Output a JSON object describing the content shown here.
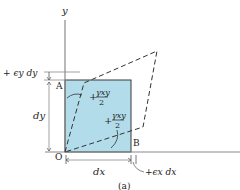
{
  "figure": {
    "caption": "(a)",
    "axes": {
      "y_label": "y"
    },
    "points": {
      "A": "A",
      "B": "B",
      "O": "O"
    },
    "dimensions": {
      "dy": "dy",
      "dx": "dx",
      "eps_y_dy": "+ ϵy dy",
      "eps_x_dx": "+ϵx dx"
    },
    "angles": {
      "upper": {
        "sign": "+",
        "numerator": "γxy",
        "denominator": "2"
      },
      "lower": {
        "sign": "+",
        "numerator": "γxy",
        "denominator": "2"
      }
    },
    "colors": {
      "element_fill": "#b3dcea",
      "element_stroke": "#3a3a3a",
      "axis": "#8a8a8a",
      "dashed": "#333333"
    }
  }
}
